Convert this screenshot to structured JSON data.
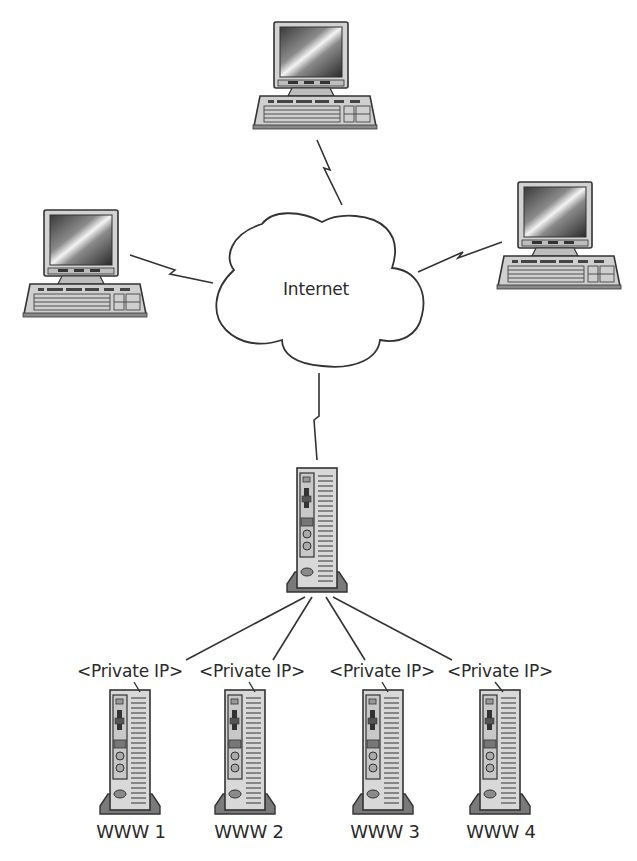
{
  "diagram": {
    "title": "",
    "cloud": {
      "label": "Internet"
    },
    "clients": [
      {
        "id": "client-top",
        "type": "workstation"
      },
      {
        "id": "client-left",
        "type": "workstation"
      },
      {
        "id": "client-right",
        "type": "workstation"
      }
    ],
    "gateway": {
      "id": "gateway-server",
      "type": "tower-server"
    },
    "web_servers": [
      {
        "id": "www1",
        "ip_label": "<Private IP>",
        "name": "WWW 1"
      },
      {
        "id": "www2",
        "ip_label": "<Private IP>",
        "name": "WWW 2"
      },
      {
        "id": "www3",
        "ip_label": "<Private IP>",
        "name": "WWW 3"
      },
      {
        "id": "www4",
        "ip_label": "<Private IP>",
        "name": "WWW 4"
      }
    ],
    "links": [
      {
        "from": "client-top",
        "to": "cloud",
        "style": "lightning"
      },
      {
        "from": "client-left",
        "to": "cloud",
        "style": "lightning"
      },
      {
        "from": "client-right",
        "to": "cloud",
        "style": "lightning"
      },
      {
        "from": "cloud",
        "to": "gateway-server",
        "style": "lightning"
      },
      {
        "from": "gateway-server",
        "to": "www1",
        "style": "line"
      },
      {
        "from": "gateway-server",
        "to": "www2",
        "style": "line"
      },
      {
        "from": "gateway-server",
        "to": "www3",
        "style": "line"
      },
      {
        "from": "gateway-server",
        "to": "www4",
        "style": "line"
      }
    ],
    "colors": {
      "line": "#333333",
      "device_body": "#d6d6d6",
      "device_base": "#7a7a7a",
      "background": "#ffffff"
    }
  }
}
